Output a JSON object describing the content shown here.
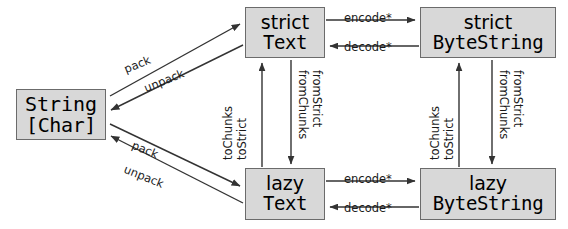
{
  "diagram": {
    "type": "conversion-graph",
    "colors": {
      "node_fill": "#d8d8d8",
      "node_border": "#6b6b6b",
      "arrow": "#333333",
      "text": "#000000",
      "background": "#ffffff"
    },
    "nodes": [
      {
        "id": "string",
        "line1": "String",
        "line2": "[Char]",
        "mono": true
      },
      {
        "id": "strict_text",
        "line1": "strict",
        "line2": "Text",
        "mono": false
      },
      {
        "id": "strict_bs",
        "line1": "strict",
        "line2": "ByteString",
        "mono": false
      },
      {
        "id": "lazy_text",
        "line1": "lazy",
        "line2": "Text",
        "mono": false
      },
      {
        "id": "lazy_bs",
        "line1": "lazy",
        "line2": "ByteString",
        "mono": false
      }
    ],
    "edges": {
      "string_to_strict_text": "pack",
      "strict_text_to_string": "unpack",
      "string_to_lazy_text": "pack",
      "lazy_text_to_string": "unpack",
      "strict_text_to_strict_bs": "encode*",
      "strict_bs_to_strict_text": "decode*",
      "lazy_text_to_lazy_bs": "encode*",
      "lazy_bs_to_lazy_text": "decode*",
      "lazy_text_to_strict_text_a": "toChunks",
      "lazy_text_to_strict_text_b": "toStrict",
      "strict_text_to_lazy_text_a": "fromChunks",
      "strict_text_to_lazy_text_b": "fromStrict",
      "lazy_bs_to_strict_bs_a": "toChunks",
      "lazy_bs_to_strict_bs_b": "toStrict",
      "strict_bs_to_lazy_bs_a": "fromChunks",
      "strict_bs_to_lazy_bs_b": "fromStrict"
    }
  }
}
